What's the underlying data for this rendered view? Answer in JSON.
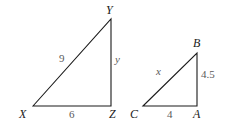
{
  "triangles": [
    {
      "name": "XYZ",
      "vertices": {
        "X": {
          "label": "X",
          "x": 33,
          "y": 106
        },
        "Y": {
          "label": "Y",
          "x": 111,
          "y": 19
        },
        "Z": {
          "label": "Z",
          "x": 111,
          "y": 106
        }
      },
      "sides": {
        "XY": "9",
        "YZ": "y",
        "XZ": "6"
      }
    },
    {
      "name": "CBA",
      "vertices": {
        "C": {
          "label": "C",
          "x": 143,
          "y": 106
        },
        "B": {
          "label": "B",
          "x": 197,
          "y": 53
        },
        "A": {
          "label": "A",
          "x": 197,
          "y": 106
        }
      },
      "sides": {
        "CB": "x",
        "BA": "4.5",
        "CA": "4"
      }
    }
  ],
  "colors": {
    "stroke": "#1a1a1a",
    "side_label": "#5a5a5a"
  }
}
